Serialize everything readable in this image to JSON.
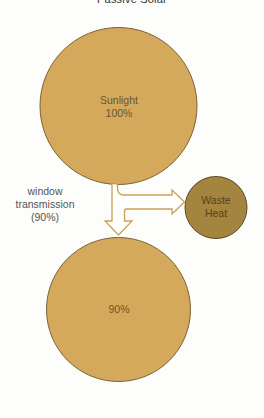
{
  "diagram": {
    "title": "Passive Solar",
    "colors": {
      "primary_fill": "#D4A95C",
      "primary_stroke": "#7a6232",
      "waste_fill": "#A3853F",
      "waste_stroke": "#5e4a20",
      "arrow_stroke": "#C9A055",
      "label_text": "#6a5528"
    },
    "nodes": {
      "sunlight": {
        "label": "Sunlight",
        "value": "100%"
      },
      "waste_heat": {
        "label_line1": "Waste",
        "label_line2": "Heat"
      },
      "result": {
        "value": "90%"
      }
    },
    "edge_label": {
      "line1": "window",
      "line2": "transmission",
      "line3": "(90%)"
    },
    "edges": [
      {
        "from": "sunlight",
        "to": "result",
        "label": "window transmission (90%)"
      },
      {
        "from": "sunlight",
        "to": "waste_heat"
      }
    ]
  }
}
